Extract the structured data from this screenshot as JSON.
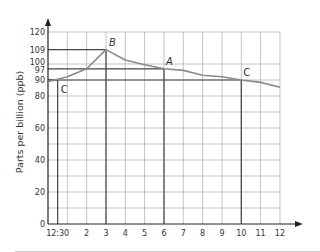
{
  "chart_data": {
    "type": "line",
    "title": "",
    "xlabel": "",
    "ylabel": "Parts per billion (ppb)",
    "xlim": [
      0,
      12
    ],
    "ylim": [
      0,
      120
    ],
    "grid": true,
    "x_tick_labels": [
      {
        "x": 0.5,
        "label": "12:30"
      },
      {
        "x": 2,
        "label": "2"
      },
      {
        "x": 3,
        "label": "3"
      },
      {
        "x": 4,
        "label": "4"
      },
      {
        "x": 5,
        "label": "5"
      },
      {
        "x": 6,
        "label": "6"
      },
      {
        "x": 7,
        "label": "7"
      },
      {
        "x": 8,
        "label": "8"
      },
      {
        "x": 9,
        "label": "9"
      },
      {
        "x": 10,
        "label": "10"
      },
      {
        "x": 11,
        "label": "11"
      },
      {
        "x": 12,
        "label": "12"
      }
    ],
    "y_tick_labels": [
      {
        "y": 0,
        "label": "0"
      },
      {
        "y": 20,
        "label": "20"
      },
      {
        "y": 40,
        "label": "40"
      },
      {
        "y": 60,
        "label": "60"
      },
      {
        "y": 80,
        "label": "80"
      },
      {
        "y": 90,
        "label": "90"
      },
      {
        "y": 97,
        "label": "97"
      },
      {
        "y": 100,
        "label": "100"
      },
      {
        "y": 109,
        "label": "109"
      },
      {
        "y": 120,
        "label": "120"
      }
    ],
    "series": [
      {
        "name": "ppb",
        "x": [
          0,
          0.5,
          1,
          2,
          3,
          4,
          5,
          6,
          7,
          8,
          9,
          10,
          11,
          12
        ],
        "values": [
          89,
          90.5,
          92,
          97,
          109,
          102.5,
          99.5,
          97,
          96,
          93,
          92,
          90,
          88.5,
          85.5
        ]
      }
    ],
    "annotations": [
      {
        "label": "C",
        "x": 0.5,
        "y": 90,
        "italic": false
      },
      {
        "label": "B",
        "x": 3,
        "y": 109,
        "italic": true
      },
      {
        "label": "A",
        "x": 6,
        "y": 97,
        "italic": true
      },
      {
        "label": "C",
        "x": 10,
        "y": 90,
        "italic": false
      }
    ],
    "reference_lines": [
      {
        "x": 0.5,
        "y": 90
      },
      {
        "x": 3,
        "y": 109
      },
      {
        "x": 6,
        "y": 97
      },
      {
        "x": 10,
        "y": 90
      }
    ]
  },
  "colors": {
    "grid": "#b4b4b4",
    "axis": "#222222",
    "reference": "#444444",
    "curve": "#8a8a8a",
    "text": "#333333"
  }
}
